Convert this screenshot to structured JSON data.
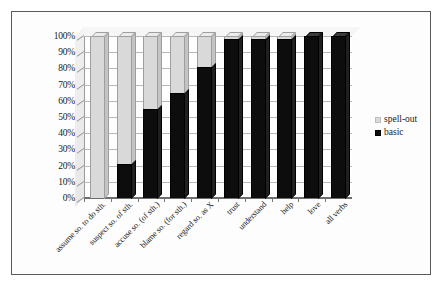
{
  "chart_data": {
    "type": "bar",
    "subtype": "stacked-percent-100",
    "title": "",
    "subtitle": "",
    "xlabel": "",
    "ylabel": "",
    "ylim": [
      0,
      100
    ],
    "ytick_labels": [
      "100%",
      "90%",
      "80%",
      "70%",
      "60%",
      "50%",
      "40%",
      "30%",
      "20%",
      "10%",
      "0%"
    ],
    "ytick_values": [
      100,
      90,
      80,
      70,
      60,
      50,
      40,
      30,
      20,
      10,
      0
    ],
    "grid": true,
    "legend_position": "right",
    "categories": [
      "assume so. to do sth.",
      "suspect so. of sth.",
      "accuse so. (of sth.)",
      "blame so. (for sth.)",
      "regard so. as X",
      "trust",
      "understand",
      "help",
      "love",
      "all verbs"
    ],
    "series": [
      {
        "name": "basic",
        "color": "#0d0d0d",
        "values": [
          0,
          21,
          55,
          65,
          81,
          98,
          98,
          98,
          100,
          100
        ]
      },
      {
        "name": "spell-out",
        "color": "#d9d9d9",
        "values": [
          100,
          79,
          45,
          35,
          19,
          2,
          2,
          2,
          0,
          0
        ]
      }
    ]
  },
  "legend": {
    "items": [
      {
        "label": "spell-out",
        "swatch": "spell-out-swatch"
      },
      {
        "label": "basic",
        "swatch": "basic-swatch"
      }
    ]
  }
}
